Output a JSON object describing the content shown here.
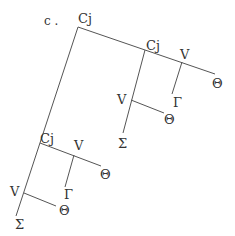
{
  "figure_label": "c .",
  "nodes": {
    "root": "Cj",
    "cj_upper": "Cj",
    "v_upper_right": "V",
    "theta_upper_right": "Θ",
    "gamma_upper": "Γ",
    "v_upper_mid": "V",
    "theta_upper_mid": "Θ",
    "sigma_upper": "Σ",
    "cj_lower": "Cj",
    "v_lower_right": "V",
    "theta_lower_right": "Θ",
    "gamma_lower": "Γ",
    "v_lower_left": "V",
    "theta_lower_left": "Θ",
    "sigma_lower": "Σ"
  },
  "colors": {
    "line": "#555555",
    "text": "#333333",
    "background": "#ffffff"
  }
}
